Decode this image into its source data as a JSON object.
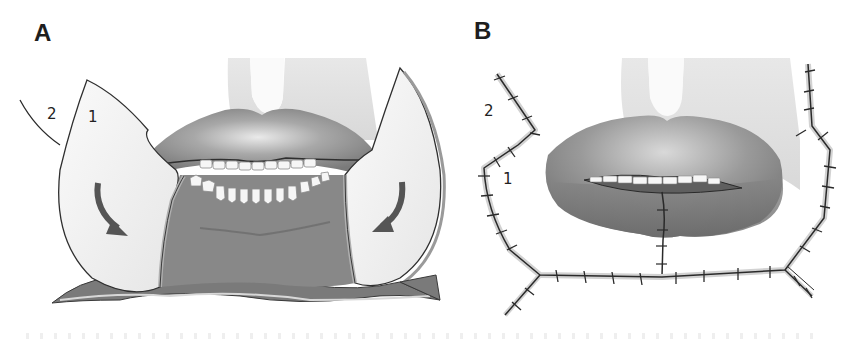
{
  "figure": {
    "panels": [
      {
        "id": "A",
        "label": "A",
        "flap_labels": [
          "2",
          "1"
        ],
        "description": "Bilateral lateral cheek flaps being rotated inward (arrows) to reconstruct lower lip defect"
      },
      {
        "id": "B",
        "label": "B",
        "flap_labels": [
          "2",
          "1"
        ],
        "description": "Flaps sutured in place with midline closure of lower lip"
      }
    ],
    "colors": {
      "background": "#ffffff",
      "lip": "#8a8a8a",
      "lip_dark": "#6e6e6e",
      "defect": "#7f7f7f",
      "flap": "#f0f0f0",
      "skin": "#d6d6d6",
      "arrow": "#555555",
      "line": "#2a2a2a",
      "teeth": "#f7f7f7"
    }
  }
}
